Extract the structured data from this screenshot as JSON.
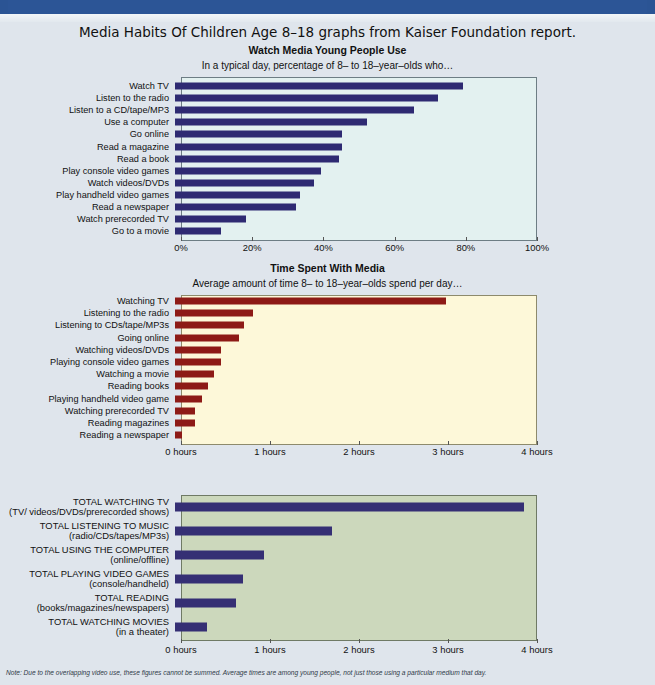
{
  "banner": {
    "text": ""
  },
  "headline": "Media Habits Of Children Age 8–18 graphs from Kaiser Foundation report.",
  "footnote": "Note: Due to the overlapping video use, these figures cannot be summed. Average times are among young people, not just those using a particular medium that day.",
  "colors": {
    "page_background": "#dfe5ec",
    "banner": "#2b5494",
    "chart1_bar": "#2e2a72",
    "chart1_plot_bg": "#e3f1f0",
    "chart2_bar": "#8d1a16",
    "chart2_plot_bg": "#fdf8d9",
    "chart3_bar": "#352f74",
    "chart3_plot_bg": "#ccd8bc"
  },
  "chart_data": [
    {
      "type": "bar",
      "orientation": "horizontal",
      "title": "Watch Media Young People Use",
      "subtitle": "In a typical day, percentage of 8– to 18–year–olds who…",
      "xlabel": "",
      "ylabel": "",
      "xlim": [
        0,
        100
      ],
      "grid": false,
      "legend": null,
      "tick_labels": [
        "0%",
        "20%",
        "40%",
        "60%",
        "80%",
        "100%"
      ],
      "tick_values": [
        0,
        20,
        40,
        60,
        80,
        100
      ],
      "categories": [
        "Watch TV",
        "Listen to the radio",
        "Listen to a CD/tape/MP3",
        "Use a computer",
        "Go online",
        "Read a magazine",
        "Read a book",
        "Play console video games",
        "Watch videos/DVDs",
        "Play handheld video games",
        "Read a newspaper",
        "Watch prerecorded TV",
        "Go to a movie"
      ],
      "values": [
        81,
        74,
        67,
        54,
        47,
        47,
        46,
        41,
        39,
        35,
        34,
        20,
        13
      ]
    },
    {
      "type": "bar",
      "orientation": "horizontal",
      "title": "Time Spent With Media",
      "subtitle": "Average amount of time 8– to 18–year–olds spend per day…",
      "xlabel": "",
      "ylabel": "",
      "xlim": [
        0,
        4
      ],
      "grid": false,
      "legend": null,
      "tick_labels": [
        "0 hours",
        "1 hours",
        "2 hours",
        "3 hours",
        "4 hours"
      ],
      "tick_values": [
        0,
        1,
        2,
        3,
        4
      ],
      "categories": [
        "Watching TV",
        "Listening to the radio",
        "Listening to CDs/tape/MP3s",
        "Going online",
        "Watching videos/DVDs",
        "Playing console video games",
        "Watching a movie",
        "Reading books",
        "Playing handheld video game",
        "Watching prerecorded TV",
        "Reading magazines",
        "Reading a newspaper"
      ],
      "values": [
        3.05,
        0.88,
        0.77,
        0.72,
        0.52,
        0.52,
        0.44,
        0.37,
        0.3,
        0.22,
        0.22,
        0.08
      ]
    },
    {
      "type": "bar",
      "orientation": "horizontal",
      "title": "",
      "subtitle": "",
      "xlabel": "",
      "ylabel": "",
      "xlim": [
        0,
        4
      ],
      "grid": false,
      "legend": null,
      "tick_labels": [
        "0 hours",
        "1 hours",
        "2 hours",
        "3 hours",
        "4 hours"
      ],
      "tick_values": [
        0,
        1,
        2,
        3,
        4
      ],
      "categories": [
        "TOTAL WATCHING TV",
        "TOTAL LISTENING TO MUSIC",
        "TOTAL USING THE COMPUTER",
        "TOTAL PLAYING VIDEO GAMES",
        "TOTAL READING",
        "TOTAL WATCHING MOVIES"
      ],
      "category_sublabels": [
        "(TV/ videos/DVDs/prerecorded shows)",
        "(radio/CDs/tapes/MP3s)",
        "(online/offline)",
        "(console/handheld)",
        "(books/magazines/newspapers)",
        "(in a theater)"
      ],
      "values": [
        3.92,
        1.76,
        1.0,
        0.76,
        0.68,
        0.36
      ]
    }
  ]
}
